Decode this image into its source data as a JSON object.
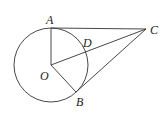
{
  "diagram": {
    "type": "geometry",
    "circle": {
      "center": "O",
      "cx": 51,
      "cy": 65,
      "r": 37
    },
    "points": [
      {
        "name": "A",
        "x": 51,
        "y": 28,
        "label_x": 46,
        "label_y": 24
      },
      {
        "name": "B",
        "x": 76,
        "y": 92,
        "label_x": 76,
        "label_y": 106
      },
      {
        "name": "C",
        "x": 146,
        "y": 29,
        "label_x": 150,
        "label_y": 34
      },
      {
        "name": "D",
        "x": 86,
        "y": 52,
        "label_x": 83,
        "label_y": 47
      },
      {
        "name": "O",
        "x": 51,
        "y": 65,
        "label_x": 40,
        "label_y": 80
      }
    ],
    "segments": [
      [
        "O",
        "A"
      ],
      [
        "O",
        "B"
      ],
      [
        "O",
        "C"
      ],
      [
        "A",
        "C"
      ],
      [
        "B",
        "C"
      ]
    ],
    "labels": {
      "A": "A",
      "B": "B",
      "C": "C",
      "D": "D",
      "O": "O"
    }
  }
}
